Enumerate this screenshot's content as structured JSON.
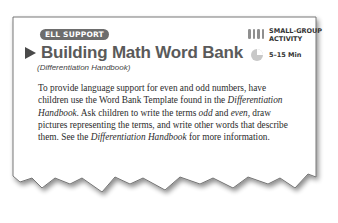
{
  "card": {
    "badge": "ELL SUPPORT",
    "title": "Building Math Word Bank",
    "subtitle": "(Differentiation Handbook)",
    "meta": {
      "group_icon": "small-group-icon",
      "group_label_line1": "SMALL-GROUP",
      "group_label_line2": "ACTIVITY",
      "time_icon": "clock-icon",
      "time_label": "5–15 Min"
    },
    "body": [
      {
        "t": "To provide language support for even and odd numbers, have children use the Word Bank Template found in the ",
        "i": false
      },
      {
        "t": "Differentiation Handbook.",
        "i": true
      },
      {
        "t": " Ask children to write the terms ",
        "i": false
      },
      {
        "t": "odd",
        "i": true
      },
      {
        "t": " and ",
        "i": false
      },
      {
        "t": "even,",
        "i": true
      },
      {
        "t": " draw pictures representing the terms, and write other words that describe them. See the ",
        "i": false
      },
      {
        "t": "Differentiation Handbook",
        "i": true
      },
      {
        "t": " for more information.",
        "i": false
      }
    ]
  },
  "colors": {
    "badge_bg": "#6d6d6d",
    "title": "#5a5a5a",
    "border": "#6a6a6a"
  }
}
